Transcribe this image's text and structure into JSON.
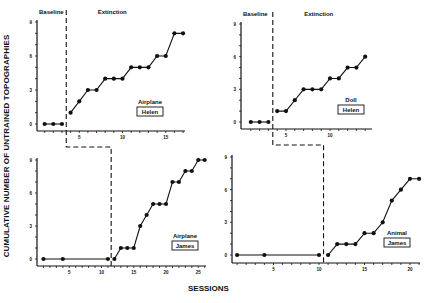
{
  "figure": {
    "y_axis_title": "CUMULATIVE NUMBER OF UNTRAINED TOPOGRAPHIES",
    "x_axis_title": "SESSIONS",
    "phase_labels": {
      "baseline": "Baseline",
      "extinction": "Extinction"
    }
  },
  "chart_data": [
    {
      "type": "line",
      "panel": "top-left",
      "title": "",
      "labels": [
        "Airplane",
        "Helen"
      ],
      "xlabel": "SESSIONS",
      "ylabel": "CUMULATIVE NUMBER OF UNTRAINED TOPOGRAPHIES",
      "ylim": [
        0,
        9
      ],
      "yticks": [
        0,
        3,
        6,
        9
      ],
      "xticks": [
        5,
        10,
        15
      ],
      "phase_change_after_session": 3.5,
      "phases": [
        "Baseline",
        "Extinction"
      ],
      "x": [
        1,
        2,
        3,
        4,
        5,
        6,
        7,
        8,
        9,
        10,
        11,
        12,
        13,
        14,
        15,
        16,
        17
      ],
      "values": [
        0,
        0,
        0,
        1,
        2,
        3,
        3,
        4,
        4,
        4,
        5,
        5,
        5,
        6,
        6,
        8,
        8
      ]
    },
    {
      "type": "line",
      "panel": "top-right",
      "title": "",
      "labels": [
        "Doll",
        "Helen"
      ],
      "xlabel": "SESSIONS",
      "ylabel": "CUMULATIVE NUMBER OF UNTRAINED TOPOGRAPHIES",
      "ylim": [
        0,
        9
      ],
      "yticks": [
        0,
        3,
        6,
        9
      ],
      "xticks": [
        5,
        10
      ],
      "phase_change_after_session": 3.5,
      "phases": [
        "Baseline",
        "Extinction"
      ],
      "x": [
        1,
        2,
        3,
        4,
        5,
        6,
        7,
        8,
        9,
        10,
        11,
        12,
        13,
        14
      ],
      "values": [
        0,
        0,
        0,
        1,
        1,
        2,
        3,
        3,
        3,
        4,
        4,
        5,
        5,
        6
      ]
    },
    {
      "type": "line",
      "panel": "bottom-left",
      "title": "",
      "labels": [
        "Airplane",
        "James"
      ],
      "xlabel": "SESSIONS",
      "ylabel": "CUMULATIVE NUMBER OF UNTRAINED TOPOGRAPHIES",
      "ylim": [
        0,
        9
      ],
      "yticks": [
        0,
        3,
        6,
        9
      ],
      "xticks": [
        5,
        10,
        15,
        20,
        25
      ],
      "phase_change_after_session": 11.5,
      "x": [
        1,
        4,
        11,
        12,
        13,
        14,
        15,
        16,
        17,
        18,
        19,
        20,
        21,
        22,
        23,
        24,
        25,
        26
      ],
      "values": [
        0,
        0,
        0,
        0,
        1,
        1,
        1,
        3,
        4,
        5,
        5,
        5,
        7,
        7,
        8,
        8,
        9,
        9
      ]
    },
    {
      "type": "line",
      "panel": "bottom-right",
      "title": "",
      "labels": [
        "Animal",
        "James"
      ],
      "xlabel": "SESSIONS",
      "ylabel": "CUMULATIVE NUMBER OF UNTRAINED TOPOGRAPHIES",
      "ylim": [
        0,
        9
      ],
      "yticks": [
        0,
        3,
        6,
        9
      ],
      "xticks": [
        5,
        10,
        15,
        20
      ],
      "phase_change_after_session": 10.5,
      "x": [
        1,
        4,
        10,
        11,
        12,
        13,
        14,
        15,
        16,
        17,
        18,
        19,
        20,
        21
      ],
      "values": [
        0,
        0,
        0,
        0,
        1,
        1,
        1,
        2,
        2,
        3,
        5,
        6,
        7,
        7
      ]
    }
  ]
}
